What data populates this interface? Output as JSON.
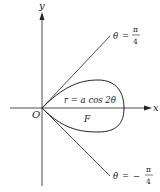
{
  "diagram": {
    "axes": {
      "x_label": "x",
      "y_label": "y",
      "origin_label": "O"
    },
    "curve": {
      "equation_r": "r",
      "equation_eq": " = ",
      "equation_rhs": "a cos 2θ",
      "region_label": "F"
    },
    "rays": {
      "upper": {
        "theta": "θ",
        "eq": "=",
        "sign": "",
        "num": "π",
        "den": "4"
      },
      "lower": {
        "theta": "θ",
        "eq": "=",
        "sign": "−",
        "num": "π",
        "den": "4"
      }
    },
    "colors": {
      "stroke": "#222222",
      "background": "#ffffff"
    }
  }
}
